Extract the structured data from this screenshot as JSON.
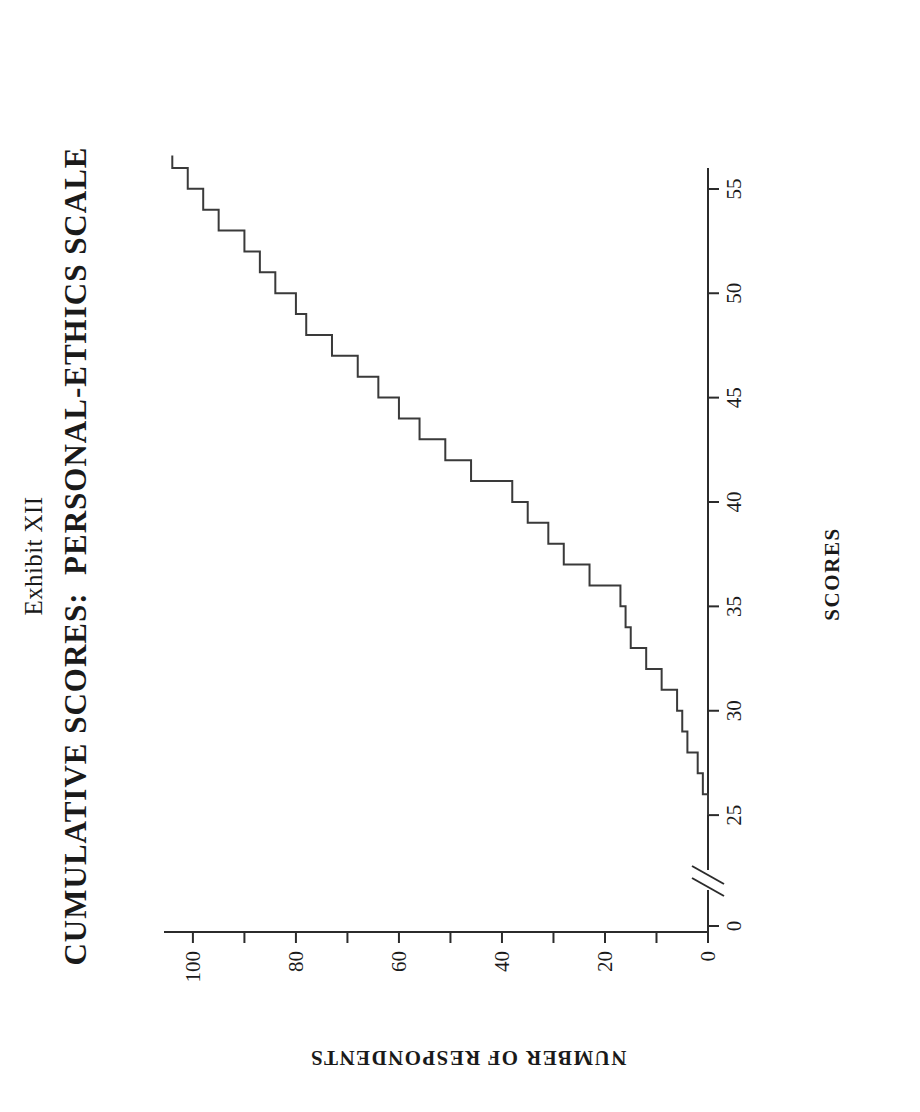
{
  "page": {
    "background": "#ffffff",
    "ink_color": "#2b2b2b",
    "orientation": "rotated-90-ccw"
  },
  "header": {
    "exhibit_label": "Exhibit XII",
    "title": "CUMULATIVE SCORES:  PERSONAL-ETHICS SCALE"
  },
  "axes": {
    "x_title": "SCORES",
    "y_title": "NUMBER OF RESPONDENTS",
    "x_ticks": [
      "0",
      "25",
      "30",
      "35",
      "40",
      "45",
      "50",
      "55"
    ],
    "y_ticks": [
      "0",
      "20",
      "40",
      "60",
      "80",
      "100"
    ],
    "axis_break": true,
    "axis_break_note": "scale break between 0 and 25 on SCORES axis"
  },
  "chart_data": {
    "type": "line",
    "title": "CUMULATIVE SCORES:  PERSONAL-ETHICS SCALE",
    "subtitle": "Exhibit XII",
    "xlabel": "SCORES",
    "ylabel": "NUMBER OF RESPONDENTS",
    "xlim": [
      24,
      56
    ],
    "ylim": [
      0,
      106
    ],
    "xticks": [
      25,
      30,
      35,
      40,
      45,
      50,
      55
    ],
    "yticks": [
      0,
      20,
      40,
      60,
      80,
      100
    ],
    "grid": false,
    "legend": null,
    "style": "step",
    "x": [
      26,
      27,
      28,
      29,
      30,
      31,
      32,
      33,
      34,
      35,
      36,
      37,
      38,
      39,
      40,
      41,
      42,
      43,
      44,
      45,
      46,
      47,
      48,
      49,
      50,
      51,
      52,
      53,
      54,
      55,
      56
    ],
    "values": [
      1,
      2,
      4,
      5,
      6,
      9,
      12,
      15,
      16,
      17,
      23,
      28,
      31,
      35,
      38,
      46,
      51,
      56,
      60,
      64,
      68,
      73,
      78,
      80,
      84,
      87,
      90,
      95,
      98,
      101,
      104
    ]
  }
}
